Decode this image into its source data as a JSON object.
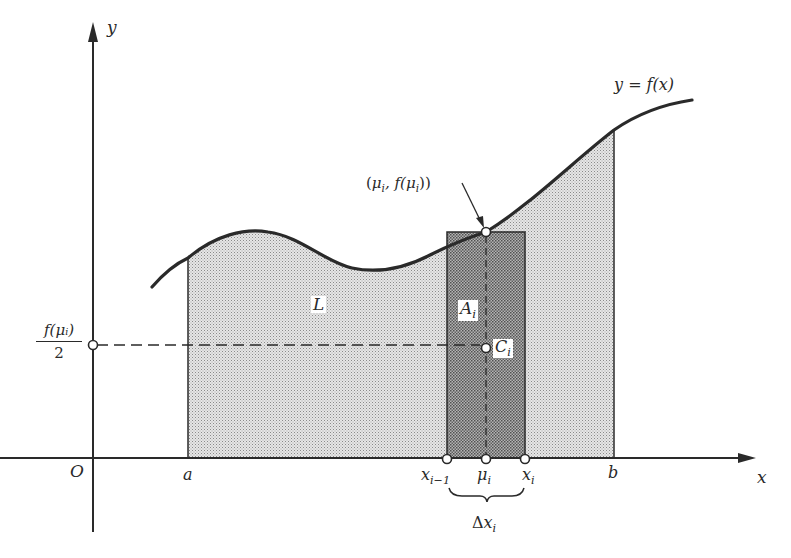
{
  "figure": {
    "title": "",
    "colors": {
      "ink": "#2a2a2a",
      "light_shade": "#d9d9d9",
      "dark_shade": "#9e9e9e",
      "background": "#ffffff"
    }
  },
  "axes": {
    "x_label": "x",
    "y_label": "y",
    "origin_label": "O"
  },
  "curve": {
    "label": "y = f(x)"
  },
  "x_ticks": {
    "a": "a",
    "b": "b",
    "x_prev_base": "x",
    "x_prev_sub": "i−1",
    "mu_base": "μ",
    "mu_sub": "i",
    "x_i_base": "x",
    "x_i_sub": "i"
  },
  "delta": {
    "symbol": "Δ",
    "base": "x",
    "sub": "i"
  },
  "point_label": {
    "open": "(",
    "mu": "μ",
    "sub1": "i",
    "mid": ", f(",
    "mu2": "μ",
    "sub2": "i",
    "close": "))"
  },
  "regions": {
    "L": "L",
    "A_base": "A",
    "A_sub": "i",
    "C_base": "C",
    "C_sub": "i"
  },
  "y_marker": {
    "numerator": "f(μᵢ)",
    "denominator": "2"
  }
}
